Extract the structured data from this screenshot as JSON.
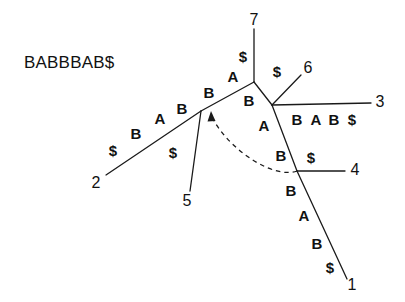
{
  "figure": {
    "type": "suffix-tree-diagram",
    "background_color": "#ffffff",
    "stroke_color": "#1a1a1a",
    "text_color": "#111111",
    "width": 405,
    "height": 302
  },
  "sequence": {
    "text": "BABBBAB$"
  },
  "leaves": [
    {
      "id": "leaf-1",
      "label": "1",
      "x": 352,
      "y": 285
    },
    {
      "id": "leaf-2",
      "label": "2",
      "x": 96,
      "y": 183
    },
    {
      "id": "leaf-3",
      "label": "3",
      "x": 380,
      "y": 102
    },
    {
      "id": "leaf-4",
      "label": "4",
      "x": 355,
      "y": 170
    },
    {
      "id": "leaf-5",
      "label": "5",
      "x": 187,
      "y": 201
    },
    {
      "id": "leaf-6",
      "label": "6",
      "x": 308,
      "y": 68
    },
    {
      "id": "leaf-7",
      "label": "7",
      "x": 254,
      "y": 20
    }
  ],
  "nodes": [
    {
      "id": "root",
      "x": 254,
      "y": 82
    },
    {
      "id": "node-left",
      "x": 201,
      "y": 111
    },
    {
      "id": "node-right",
      "x": 272,
      "y": 105
    },
    {
      "id": "node-low",
      "x": 297,
      "y": 171
    }
  ],
  "edges": [
    {
      "id": "edge-root-7",
      "from": "root",
      "to": "leaf-7",
      "x1": 254,
      "y1": 82,
      "x2": 254,
      "y2": 29
    },
    {
      "id": "edge-root-left",
      "from": "root",
      "to": "node-left",
      "x1": 254,
      "y1": 82,
      "x2": 201,
      "y2": 111
    },
    {
      "id": "edge-left-2",
      "from": "node-left",
      "to": "leaf-2",
      "x1": 201,
      "y1": 111,
      "x2": 106,
      "y2": 175
    },
    {
      "id": "edge-left-5",
      "from": "node-left",
      "to": "leaf-5",
      "x1": 201,
      "y1": 111,
      "x2": 190,
      "y2": 191
    },
    {
      "id": "edge-root-right",
      "from": "root",
      "to": "node-right",
      "x1": 254,
      "y1": 82,
      "x2": 272,
      "y2": 105
    },
    {
      "id": "edge-right-6",
      "from": "node-right",
      "to": "leaf-6",
      "x1": 272,
      "y1": 105,
      "x2": 301,
      "y2": 75
    },
    {
      "id": "edge-right-3",
      "from": "node-right",
      "to": "leaf-3",
      "x1": 272,
      "y1": 105,
      "x2": 371,
      "y2": 103
    },
    {
      "id": "edge-right-low",
      "from": "node-right",
      "to": "node-low",
      "x1": 272,
      "y1": 105,
      "x2": 297,
      "y2": 171
    },
    {
      "id": "edge-low-4",
      "from": "node-low",
      "to": "leaf-4",
      "x1": 297,
      "y1": 171,
      "x2": 345,
      "y2": 171
    },
    {
      "id": "edge-low-1",
      "from": "node-low",
      "to": "leaf-1",
      "x1": 297,
      "y1": 171,
      "x2": 347,
      "y2": 279
    }
  ],
  "edge_labels": [
    {
      "id": "el-root-7-dollar",
      "text": "$",
      "x": 243,
      "y": 56
    },
    {
      "id": "el-root-left-a",
      "text": "A",
      "x": 233,
      "y": 76
    },
    {
      "id": "el-root-left-b",
      "text": "B",
      "x": 209,
      "y": 92
    },
    {
      "id": "el-left-2-b",
      "text": "B",
      "x": 182,
      "y": 108
    },
    {
      "id": "el-left-2-a",
      "text": "A",
      "x": 160,
      "y": 118
    },
    {
      "id": "el-left-2-b2",
      "text": "B",
      "x": 136,
      "y": 133
    },
    {
      "id": "el-left-2-dollar",
      "text": "$",
      "x": 113,
      "y": 150
    },
    {
      "id": "el-left-5-dollar",
      "text": "$",
      "x": 173,
      "y": 152
    },
    {
      "id": "el-right-6-dollar",
      "text": "$",
      "x": 277,
      "y": 71
    },
    {
      "id": "el-root-right-b",
      "text": "B",
      "x": 249,
      "y": 100
    },
    {
      "id": "el-right-low-a",
      "text": "A",
      "x": 264,
      "y": 125
    },
    {
      "id": "el-right-low-b",
      "text": "B",
      "x": 281,
      "y": 155
    },
    {
      "id": "el-low-4-dollar",
      "text": "$",
      "x": 311,
      "y": 157
    },
    {
      "id": "el-low-1-b",
      "text": "B",
      "x": 291,
      "y": 190
    },
    {
      "id": "el-low-1-a",
      "text": "A",
      "x": 304,
      "y": 215
    },
    {
      "id": "el-low-1-b2",
      "text": "B",
      "x": 317,
      "y": 243
    },
    {
      "id": "el-low-1-dollar",
      "text": "$",
      "x": 330,
      "y": 267
    },
    {
      "id": "el-right-3-b",
      "text": "B",
      "x": 297,
      "y": 119
    },
    {
      "id": "el-right-3-a",
      "text": "A",
      "x": 316,
      "y": 119
    },
    {
      "id": "el-right-3-b2",
      "text": "B",
      "x": 334,
      "y": 119
    },
    {
      "id": "el-right-3-dollar",
      "text": "$",
      "x": 352,
      "y": 119
    }
  ],
  "suffix_link": {
    "id": "suffix-link",
    "style": "dashed",
    "path": "M 297 171 C 275 178 232 152 213 119",
    "arrow_x": 211,
    "arrow_y": 114
  }
}
